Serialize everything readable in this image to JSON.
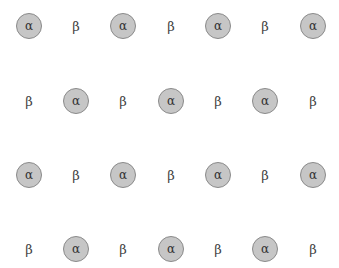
{
  "diagram": {
    "colors": {
      "alpha_fill": "#c6c6c6",
      "alpha_border": "#8a8a8a",
      "text": "#333333",
      "background": "#ffffff"
    },
    "column_x": [
      29,
      76,
      123,
      171,
      218,
      265,
      313
    ],
    "row_y": [
      26,
      101,
      175,
      249
    ],
    "rows": [
      [
        "α",
        "β",
        "α",
        "β",
        "α",
        "β",
        "α"
      ],
      [
        "β",
        "α",
        "β",
        "α",
        "β",
        "α",
        "β"
      ],
      [
        "α",
        "β",
        "α",
        "β",
        "α",
        "β",
        "α"
      ],
      [
        "β",
        "α",
        "β",
        "α",
        "β",
        "α",
        "β"
      ]
    ]
  }
}
